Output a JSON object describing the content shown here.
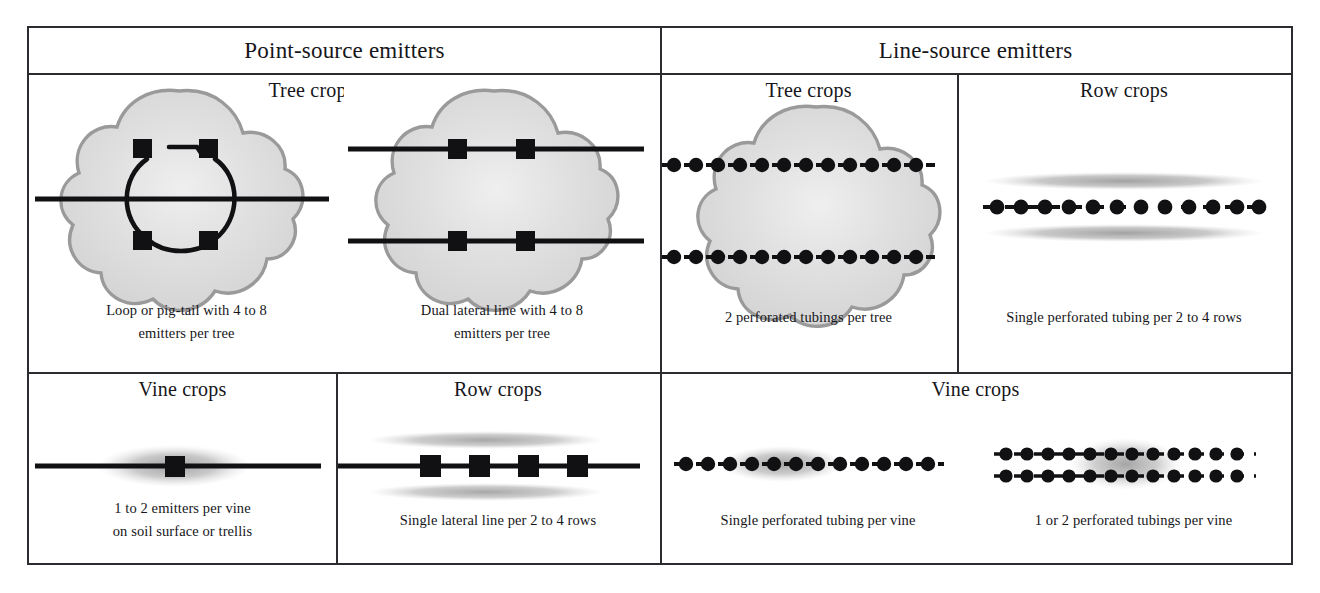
{
  "figure": {
    "type": "comparison-table-diagram"
  },
  "headers": [
    {
      "id": "point-source",
      "label": "Point-source emitters"
    },
    {
      "id": "line-source",
      "label": "Line-source emitters"
    }
  ],
  "cells": [
    {
      "id": "ps-tree-loop",
      "section": "point-source",
      "title": "Tree crops",
      "caption": "Loop or pig-tail with 4 to 8\nemitters per tree",
      "caption_line1": "Loop or pig-tail with 4 to 8",
      "caption_line2": "emitters per tree",
      "art": "tree-canopy-with-loop-lateral-and-4-point-emitters",
      "emitter_count": 4,
      "emitter_shape": "square",
      "lateral_lines": 1
    },
    {
      "id": "ps-tree-dual",
      "section": "point-source",
      "title": "Tree crops",
      "caption_line1": "Dual lateral line with 4 to 8",
      "caption_line2": "emitters per tree",
      "art": "tree-canopy-with-two-lateral-lines-and-4-point-emitters",
      "emitter_count": 4,
      "emitter_shape": "square",
      "lateral_lines": 2
    },
    {
      "id": "ls-tree",
      "section": "line-source",
      "title": "Tree crops",
      "caption_line1": "2 perforated tubings per tree",
      "caption_line2": "",
      "art": "tree-canopy-with-two-perforated-tubings",
      "emitter_shape": "circle",
      "lateral_lines": 2
    },
    {
      "id": "ls-row",
      "section": "line-source",
      "title": "Row crops",
      "caption_line1": "Single perforated tubing per 2 to 4 rows",
      "caption_line2": "",
      "art": "single-perforated-tubing-between-two-wetted-row-strips",
      "emitter_shape": "circle",
      "lateral_lines": 1,
      "wetted_strips": 2
    },
    {
      "id": "ps-vine",
      "section": "point-source",
      "title": "Vine crops",
      "caption_line1": "1 to 2 emitters per vine",
      "caption_line2": "on soil surface or trellis",
      "art": "lateral-line-with-single-point-emitter-and-wetted-bulb",
      "emitter_count": 1,
      "emitter_shape": "square",
      "lateral_lines": 1
    },
    {
      "id": "ps-row",
      "section": "point-source",
      "title": "Row crops",
      "caption_line1": "Single lateral line per 2 to 4 rows",
      "caption_line2": "",
      "art": "single-lateral-line-with-4-point-emitters-between-two-wetted-row-strips",
      "emitter_count": 4,
      "emitter_shape": "square",
      "lateral_lines": 1,
      "wetted_strips": 2
    },
    {
      "id": "ls-vine-single",
      "section": "line-source",
      "title": "Vine crops",
      "caption_line1": "Single perforated tubing per vine",
      "caption_line2": "",
      "art": "single-perforated-tubing-with-wetted-bulb",
      "emitter_shape": "circle",
      "lateral_lines": 1
    },
    {
      "id": "ls-vine-dual",
      "section": "line-source",
      "title": "Vine crops",
      "caption_line1": "1 or 2 perforated tubings per vine",
      "caption_line2": "",
      "art": "two-perforated-tubings-with-wetted-bulb",
      "emitter_shape": "circle",
      "lateral_lines": 2
    }
  ],
  "shared_titles": {
    "ls_vine_spanning": "Vine crops"
  },
  "colors": {
    "ink": "#16161a",
    "rule": "#2b2b30",
    "canopy_fill": "#d9d9d9",
    "canopy_outline": "#8c8c8c",
    "wetted_soil": "#b4b4b4",
    "paper": "#ffffff"
  }
}
